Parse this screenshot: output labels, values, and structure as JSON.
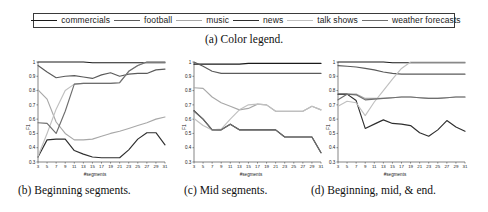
{
  "figure": {
    "caption_a": "(a) Color legend.",
    "caption_b": "(b) Beginning segments.",
    "caption_c": "(c) Mid segments.",
    "caption_d": "(d) Beginning, mid, & end."
  },
  "legend": {
    "items": [
      {
        "label": "commercials",
        "color": "#1a1a1a"
      },
      {
        "label": "football",
        "color": "#5b5b5b"
      },
      {
        "label": "music",
        "color": "#a8a8a8"
      },
      {
        "label": "news",
        "color": "#2e2e2e"
      },
      {
        "label": "talk shows",
        "color": "#c0c0c0"
      },
      {
        "label": "weather forecasts",
        "color": "#6e6e6e"
      }
    ]
  },
  "chart_data": [
    {
      "type": "line",
      "title": "(b) Beginning segments.",
      "xlabel": "#segments",
      "ylabel": "F1",
      "xlim": [
        3,
        31
      ],
      "ylim": [
        0.3,
        1.0
      ],
      "yticks": [
        0.3,
        0.4,
        0.5,
        0.6,
        0.7,
        0.8,
        0.9,
        1.0
      ],
      "ytick_labels": [
        "0.3",
        "0.4",
        "0.5",
        "0.6",
        "0.7",
        "0.8",
        "0.9",
        "1"
      ],
      "x": [
        3,
        5,
        7,
        9,
        11,
        13,
        15,
        17,
        19,
        21,
        23,
        25,
        27,
        29,
        31
      ],
      "xtick_labels": [
        "3",
        "5",
        "7",
        "9",
        "11",
        "13",
        "15",
        "17",
        "19",
        "21",
        "23",
        "25",
        "27",
        "29",
        "31"
      ],
      "grid": false,
      "legend_position": "external-top",
      "series": [
        {
          "name": "commercials",
          "color": "#1a1a1a",
          "values": [
            1.0,
            1.0,
            1.0,
            1.0,
            1.0,
            1.0,
            0.995,
            0.995,
            0.995,
            0.995,
            0.995,
            0.995,
            0.995,
            0.995,
            0.995
          ]
        },
        {
          "name": "football",
          "color": "#5b5b5b",
          "values": [
            0.975,
            0.93,
            0.89,
            0.9,
            0.905,
            0.895,
            0.885,
            0.91,
            0.925,
            0.9,
            0.915,
            0.92,
            0.92,
            0.945,
            0.95
          ]
        },
        {
          "name": "music",
          "color": "#a8a8a8",
          "values": [
            0.805,
            0.74,
            0.58,
            0.5,
            0.455,
            0.455,
            0.46,
            0.48,
            0.5,
            0.515,
            0.535,
            0.555,
            0.575,
            0.6,
            0.615
          ]
        },
        {
          "name": "news",
          "color": "#2e2e2e",
          "values": [
            0.335,
            0.455,
            0.46,
            0.46,
            0.38,
            0.355,
            0.335,
            0.33,
            0.33,
            0.33,
            0.385,
            0.46,
            0.505,
            0.505,
            0.42
          ]
        },
        {
          "name": "talk shows",
          "color": "#c0c0c0",
          "values": [
            0.34,
            0.5,
            0.67,
            0.8,
            0.845,
            0.85,
            0.85,
            0.85,
            0.85,
            0.855,
            0.935,
            0.975,
            1.0,
            1.0,
            1.0
          ]
        },
        {
          "name": "weather forecasts",
          "color": "#6e6e6e",
          "values": [
            0.575,
            0.57,
            0.5,
            0.655,
            0.845,
            0.85,
            0.85,
            0.85,
            0.85,
            0.855,
            0.935,
            0.975,
            1.0,
            1.0,
            1.0
          ]
        }
      ]
    },
    {
      "type": "line",
      "title": "(c) Mid segments.",
      "xlabel": "#segments",
      "ylabel": "F1",
      "xlim": [
        3,
        31
      ],
      "ylim": [
        0.3,
        1.0
      ],
      "yticks": [
        0.3,
        0.4,
        0.5,
        0.6,
        0.7,
        0.8,
        0.9,
        1.0
      ],
      "ytick_labels": [
        "0.3",
        "0.4",
        "0.5",
        "0.6",
        "0.7",
        "0.8",
        "0.9",
        "1"
      ],
      "x": [
        3,
        5,
        7,
        9,
        11,
        13,
        15,
        17,
        19,
        21,
        23,
        25,
        27,
        29,
        31
      ],
      "xtick_labels": [
        "3",
        "5",
        "7",
        "9",
        "11",
        "13",
        "15",
        "17",
        "19",
        "21",
        "23",
        "25",
        "27",
        "29",
        "31"
      ],
      "grid": false,
      "legend_position": "external-top",
      "series": [
        {
          "name": "commercials",
          "color": "#1a1a1a",
          "values": [
            0.985,
            0.985,
            0.985,
            0.985,
            0.985,
            0.985,
            0.99,
            0.99,
            0.99,
            0.99,
            0.99,
            0.99,
            0.99,
            0.99,
            0.99
          ]
        },
        {
          "name": "football",
          "color": "#5b5b5b",
          "values": [
            1.0,
            0.97,
            0.935,
            0.92,
            0.92,
            0.92,
            0.92,
            0.92,
            0.92,
            0.92,
            0.92,
            0.92,
            0.92,
            0.92,
            0.92
          ]
        },
        {
          "name": "music",
          "color": "#a8a8a8",
          "values": [
            0.82,
            0.815,
            0.755,
            0.715,
            0.69,
            0.665,
            0.675,
            0.705,
            0.7,
            0.655,
            0.655,
            0.655,
            0.655,
            0.69,
            0.665
          ]
        },
        {
          "name": "news",
          "color": "#2e2e2e",
          "values": [
            0.66,
            0.6,
            0.525,
            0.525,
            0.565,
            0.525,
            0.525,
            0.525,
            0.525,
            0.525,
            0.475,
            0.475,
            0.475,
            0.475,
            0.365
          ]
        },
        {
          "name": "talk shows",
          "color": "#c0c0c0",
          "values": [
            0.605,
            0.555,
            0.525,
            0.53,
            0.6,
            0.665,
            0.7,
            0.705,
            0.7,
            0.655,
            0.655,
            0.655,
            0.655,
            0.69,
            0.665
          ]
        },
        {
          "name": "weather forecasts",
          "color": "#6e6e6e",
          "values": [
            0.655,
            0.6,
            0.525,
            0.525,
            0.565,
            0.525,
            0.525,
            0.525,
            0.525,
            0.525,
            0.475,
            0.475,
            0.475,
            0.475,
            0.365
          ]
        }
      ]
    },
    {
      "type": "line",
      "title": "(d) Beginning, mid, & end.",
      "xlabel": "#segments",
      "ylabel": "F1",
      "xlim": [
        3,
        31
      ],
      "ylim": [
        0.3,
        1.0
      ],
      "yticks": [
        0.3,
        0.4,
        0.5,
        0.6,
        0.7,
        0.8,
        0.9,
        1.0
      ],
      "ytick_labels": [
        "0.3",
        "0.4",
        "0.5",
        "0.6",
        "0.7",
        "0.8",
        "0.9",
        "1"
      ],
      "x": [
        3,
        5,
        7,
        9,
        11,
        13,
        15,
        17,
        19,
        21,
        23,
        25,
        27,
        29,
        31
      ],
      "xtick_labels": [
        "3",
        "5",
        "7",
        "9",
        "11",
        "13",
        "15",
        "17",
        "19",
        "21",
        "23",
        "25",
        "27",
        "29",
        "31"
      ],
      "grid": false,
      "legend_position": "external-top",
      "series": [
        {
          "name": "commercials",
          "color": "#1a1a1a",
          "values": [
            1.0,
            1.0,
            1.0,
            1.0,
            1.0,
            1.0,
            0.995,
            0.995,
            0.995,
            0.995,
            0.995,
            0.995,
            0.995,
            0.995,
            0.995
          ]
        },
        {
          "name": "football",
          "color": "#5b5b5b",
          "values": [
            0.975,
            0.97,
            0.965,
            0.955,
            0.945,
            0.93,
            0.92,
            0.915,
            0.915,
            0.915,
            0.915,
            0.915,
            0.915,
            0.915,
            0.915
          ]
        },
        {
          "name": "music",
          "color": "#a8a8a8",
          "values": [
            0.775,
            0.775,
            0.775,
            0.745,
            0.745,
            0.745,
            0.75,
            0.755,
            0.755,
            0.75,
            0.745,
            0.745,
            0.75,
            0.755,
            0.755
          ]
        },
        {
          "name": "news",
          "color": "#2e2e2e",
          "values": [
            0.775,
            0.775,
            0.73,
            0.535,
            0.565,
            0.595,
            0.57,
            0.565,
            0.555,
            0.505,
            0.48,
            0.525,
            0.59,
            0.545,
            0.515
          ]
        },
        {
          "name": "talk shows",
          "color": "#c0c0c0",
          "values": [
            0.69,
            0.725,
            0.715,
            0.625,
            0.72,
            0.8,
            0.88,
            0.955,
            1.0,
            1.0,
            1.0,
            1.0,
            1.0,
            1.0,
            1.0
          ]
        },
        {
          "name": "weather forecasts",
          "color": "#6e6e6e",
          "values": [
            0.735,
            0.775,
            0.77,
            0.735,
            0.74,
            0.745,
            0.75,
            0.755,
            0.755,
            0.75,
            0.745,
            0.745,
            0.75,
            0.755,
            0.755
          ]
        }
      ]
    }
  ]
}
